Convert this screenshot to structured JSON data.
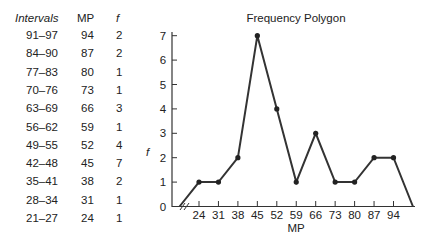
{
  "table": {
    "headers": {
      "intervals": "Intervals",
      "mp": "MP",
      "f": "f"
    },
    "rows": [
      {
        "interval": "91–97",
        "mp": "94",
        "f": "2"
      },
      {
        "interval": "84–90",
        "mp": "87",
        "f": "2"
      },
      {
        "interval": "77–83",
        "mp": "80",
        "f": "1"
      },
      {
        "interval": "70–76",
        "mp": "73",
        "f": "1"
      },
      {
        "interval": "63–69",
        "mp": "66",
        "f": "3"
      },
      {
        "interval": "56–62",
        "mp": "59",
        "f": "1"
      },
      {
        "interval": "49–55",
        "mp": "52",
        "f": "4"
      },
      {
        "interval": "42–48",
        "mp": "45",
        "f": "7"
      },
      {
        "interval": "35–41",
        "mp": "38",
        "f": "2"
      },
      {
        "interval": "28–34",
        "mp": "31",
        "f": "1"
      },
      {
        "interval": "21–27",
        "mp": "24",
        "f": "1"
      }
    ]
  },
  "chart_data": {
    "type": "line",
    "title": "Frequency Polygon",
    "xlabel": "MP",
    "ylabel": "f",
    "categories": [
      "24",
      "31",
      "38",
      "45",
      "52",
      "59",
      "66",
      "73",
      "80",
      "87",
      "94"
    ],
    "x": [
      24,
      31,
      38,
      45,
      52,
      59,
      66,
      73,
      80,
      87,
      94
    ],
    "values": [
      1,
      1,
      2,
      7,
      4,
      1,
      3,
      1,
      1,
      2,
      2
    ],
    "endpoints_to_zero": [
      17,
      101
    ],
    "ylim": [
      0,
      7
    ],
    "yticks": [
      "0",
      "1",
      "2",
      "3",
      "4",
      "5",
      "6",
      "7"
    ],
    "axis_break": "//",
    "grid": false,
    "legend": null
  }
}
